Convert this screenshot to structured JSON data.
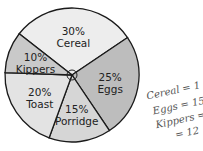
{
  "chart_data": {
    "type": "pie",
    "title": "",
    "categories": [
      "Cereal",
      "Eggs",
      "Porridge",
      "Toast",
      "Kippers"
    ],
    "values": [
      30,
      25,
      15,
      20,
      10
    ],
    "unit": "%",
    "labels": [
      "30%",
      "25%",
      "15%",
      "20%",
      "10%"
    ],
    "colors": [
      "#ededed",
      "#bdbdbd",
      "#d6d6d6",
      "#e3e3e3",
      "#c9c9c9"
    ],
    "legend": "none",
    "annotations": [
      "Cereal = 1…",
      "Eggs = 15",
      "Kippers = 6",
      "… = 12"
    ]
  },
  "handwritten_notes": [
    "Cereal = 1",
    "Eggs = 15",
    "Kippers = 6",
    "= 12"
  ]
}
